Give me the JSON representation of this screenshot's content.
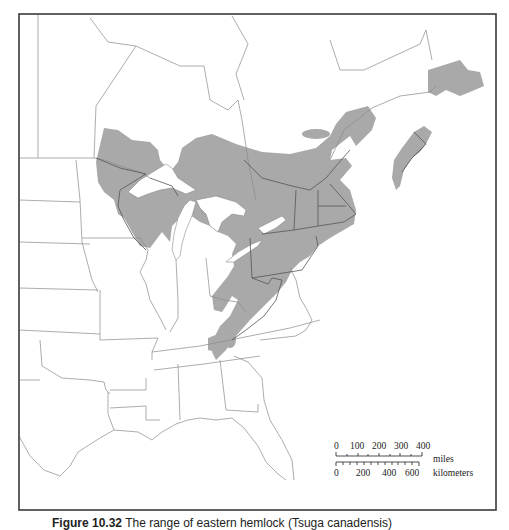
{
  "figure": {
    "caption_label": "Figure 10.32",
    "caption_text": "The range of eastern hemlock (Tsuga canadensis)"
  },
  "map": {
    "subject": "Species range map, eastern North America",
    "colors": {
      "range_fill": "#a9a9a9",
      "border": "#8a8a8a",
      "frame": "#3a3a3a",
      "background": "#ffffff"
    },
    "frame": {
      "x": 19,
      "y": 14,
      "width": 477,
      "height": 496
    },
    "range_polygons": [
      "M96,162 L104,128 L118,130 L132,140 L150,142 L158,150 L160,160 L170,172 L178,162 L182,148 L196,138 L212,134 L236,144 L262,152 L290,154 L316,148 L330,136 L336,124 L346,112 L368,106 L376,118 L372,130 L362,140 L356,146 L350,136 L332,150 L330,160 L346,158 L352,166 L340,180 L350,190 L356,210 L354,224 L330,238 L318,246 L310,256 L300,262 L292,270 L286,282 L278,292 L270,300 L262,308 L250,320 L236,336 L226,350 L216,360 L212,352 L214,338 L220,326 L230,316 L238,300 L232,296 L226,306 L222,312 L214,310 L212,296 L220,286 L228,276 L234,266 L232,254 L236,244 L228,236 L218,232 L210,226 L200,222 L186,212 L178,220 L172,226 L170,242 L162,232 L150,248 L140,246 L132,232 L124,218 L118,214 L114,200 L104,192 L98,182 Z",
      "M428,70 L460,60 L468,70 L480,72 L484,86 L470,92 L460,96 L446,90 L436,96 L428,92 Z",
      "M414,132 L424,126 L432,132 L426,144 L420,152 L412,158 L404,170 L400,186 L396,190 L392,178 L394,160 L402,148 L408,140 Z",
      "M208,338 L218,334 L222,342 L216,352 L208,350 Z"
    ],
    "scale_bar": {
      "miles_ticks": [
        "0",
        "100",
        "200",
        "300",
        "400"
      ],
      "miles_label": "miles",
      "km_ticks": [
        "0",
        "200",
        "400",
        "600"
      ],
      "km_label": "kilometers"
    }
  }
}
